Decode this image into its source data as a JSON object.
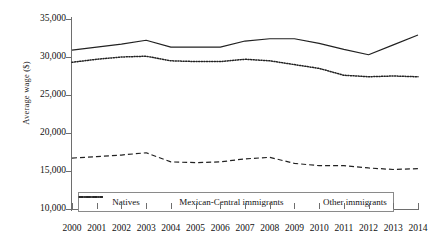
{
  "chart_data": {
    "type": "line",
    "title": "",
    "xlabel": "",
    "ylabel": "Average  wage ($)",
    "ylim": [
      10000,
      35000
    ],
    "ytick_step": 5000,
    "yticks": [
      "10,000",
      "15,000",
      "20,000",
      "25,000",
      "30,000",
      "35,000"
    ],
    "ytick_values": [
      10000,
      15000,
      20000,
      25000,
      30000,
      35000
    ],
    "grid": false,
    "legend_position": "bottom-inside",
    "categories": [
      "2000",
      "2001",
      "2002",
      "2003",
      "2004",
      "2005",
      "2006",
      "2007",
      "2008",
      "2009",
      "2010",
      "2011",
      "2012",
      "2013",
      "2014"
    ],
    "x": [
      2000,
      2001,
      2002,
      2003,
      2004,
      2005,
      2006,
      2007,
      2008,
      2009,
      2010,
      2011,
      2012,
      2013,
      2014
    ],
    "series": [
      {
        "name": "Natives",
        "style": "dotted",
        "color": "#222222",
        "values": [
          29300,
          29700,
          30000,
          30100,
          29500,
          29400,
          29400,
          29700,
          29500,
          29000,
          28500,
          27600,
          27400,
          27500,
          27400
        ]
      },
      {
        "name": "Mexican-Central immigrants",
        "style": "dashed",
        "color": "#222222",
        "values": [
          16700,
          16900,
          17100,
          17400,
          16200,
          16100,
          16200,
          16600,
          16800,
          16000,
          15700,
          15700,
          15400,
          15200,
          15300
        ]
      },
      {
        "name": "Other immigrants",
        "style": "solid",
        "color": "#222222",
        "values": [
          30900,
          31300,
          31700,
          32200,
          31300,
          31300,
          31300,
          32100,
          32400,
          32400,
          31800,
          31000,
          30300,
          31600,
          32900
        ]
      }
    ]
  },
  "legend": {
    "items": [
      {
        "label": "Natives",
        "style": "dotted"
      },
      {
        "label": "Mexican-Central immigrants",
        "style": "dashed"
      },
      {
        "label": "Other immigrants",
        "style": "solid"
      }
    ]
  }
}
